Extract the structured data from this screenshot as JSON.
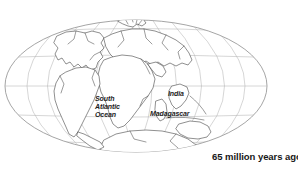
{
  "figure": {
    "type": "paleogeographic-map",
    "projection": "oval (Mollweide-style) global projection",
    "background_color": "#ffffff",
    "graticule_color": "#b4b4b4",
    "coastline_color": "#4a4a4a",
    "text_color": "#1a1a1a"
  },
  "map": {
    "labels": {
      "south_atlantic_line1": "South",
      "south_atlantic_line2": "Atlantic",
      "south_atlantic_line3": "Ocean",
      "india": "India",
      "madagascar": "Madagascar"
    }
  },
  "captions": {
    "left": "go",
    "right": "65 million years ago"
  }
}
